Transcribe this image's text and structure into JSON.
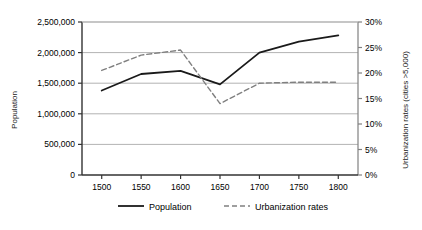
{
  "chart_data": {
    "type": "line",
    "title": "",
    "xlabel": "",
    "ylabel": "Population",
    "y2label": "Urbanization rates (cities >5,000)",
    "x": [
      1500,
      1550,
      1600,
      1650,
      1700,
      1750,
      1800
    ],
    "xlim": [
      1475,
      1825
    ],
    "ylim": [
      0,
      2500000
    ],
    "y2lim": [
      0,
      0.3
    ],
    "grid": true,
    "legend_position": "bottom",
    "series": [
      {
        "name": "Population",
        "axis": "left",
        "style": "solid",
        "color": "#1a1a1a",
        "values": [
          1380000,
          1650000,
          1700000,
          1480000,
          2000000,
          2180000,
          2280000
        ]
      },
      {
        "name": "Urbanization rates",
        "axis": "right",
        "style": "dashed",
        "color": "#808080",
        "values": [
          0.205,
          0.235,
          0.245,
          0.14,
          0.18,
          0.182,
          0.182
        ]
      }
    ],
    "y_ticks": [
      {
        "value": 0,
        "label": "0"
      },
      {
        "value": 500000,
        "label": "500,000"
      },
      {
        "value": 1000000,
        "label": "1,000,000"
      },
      {
        "value": 1500000,
        "label": "1,500,000"
      },
      {
        "value": 2000000,
        "label": "2,000,000"
      },
      {
        "value": 2500000,
        "label": "2,500,000"
      }
    ],
    "x_ticks": [
      {
        "value": 1500,
        "label": "1500"
      },
      {
        "value": 1550,
        "label": "1550"
      },
      {
        "value": 1600,
        "label": "1600"
      },
      {
        "value": 1650,
        "label": "1650"
      },
      {
        "value": 1700,
        "label": "1700"
      },
      {
        "value": 1750,
        "label": "1750"
      },
      {
        "value": 1800,
        "label": "1800"
      }
    ],
    "y2_ticks": [
      {
        "value": 0.0,
        "label": "0%"
      },
      {
        "value": 0.05,
        "label": "5%"
      },
      {
        "value": 0.1,
        "label": "10%"
      },
      {
        "value": 0.15,
        "label": "15%"
      },
      {
        "value": 0.2,
        "label": "20%"
      },
      {
        "value": 0.25,
        "label": "25%"
      },
      {
        "value": 0.3,
        "label": "30%"
      }
    ],
    "legend": [
      {
        "label": "Population",
        "style": "solid",
        "color": "#1a1a1a"
      },
      {
        "label": "Urbanization rates",
        "style": "dashed",
        "color": "#808080"
      }
    ],
    "colors": {
      "population_line": "#1a1a1a",
      "urbanization_line": "#808080",
      "gridline": "#b3b3b3",
      "axis": "#4d4d4d",
      "background": "#ffffff"
    }
  }
}
